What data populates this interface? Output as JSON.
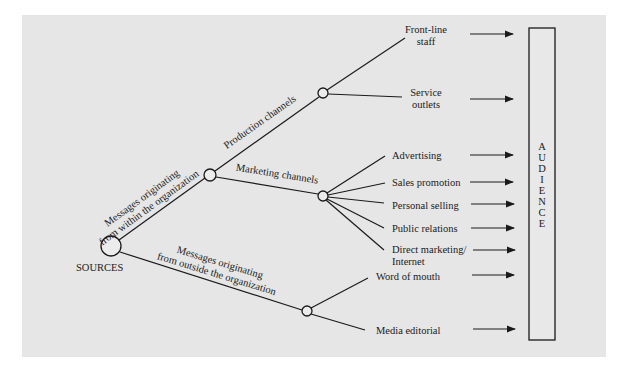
{
  "diagram": {
    "root": {
      "label": "SOURCES"
    },
    "branches": {
      "internal": {
        "label_line1": "Messages originating",
        "label_line2": "from within the organization",
        "production": {
          "label": "Production channels",
          "targets": [
            {
              "line1": "Front-line",
              "line2": "staff"
            },
            {
              "line1": "Service",
              "line2": "outlets"
            }
          ]
        },
        "marketing": {
          "label": "Marketing channels",
          "targets": [
            {
              "line1": "Advertising"
            },
            {
              "line1": "Sales promotion"
            },
            {
              "line1": "Personal selling"
            },
            {
              "line1": "Public relations"
            },
            {
              "line1": "Direct marketing/",
              "line2": "Internet"
            }
          ]
        }
      },
      "external": {
        "label_line1": "Messages originating",
        "label_line2": "from outside the organization",
        "targets": [
          {
            "line1": "Word of mouth"
          },
          {
            "line1": "Media editorial"
          }
        ]
      }
    },
    "audience": {
      "label": "AUDIENCE",
      "letters": [
        "A",
        "U",
        "D",
        "I",
        "E",
        "N",
        "C",
        "E"
      ]
    }
  }
}
